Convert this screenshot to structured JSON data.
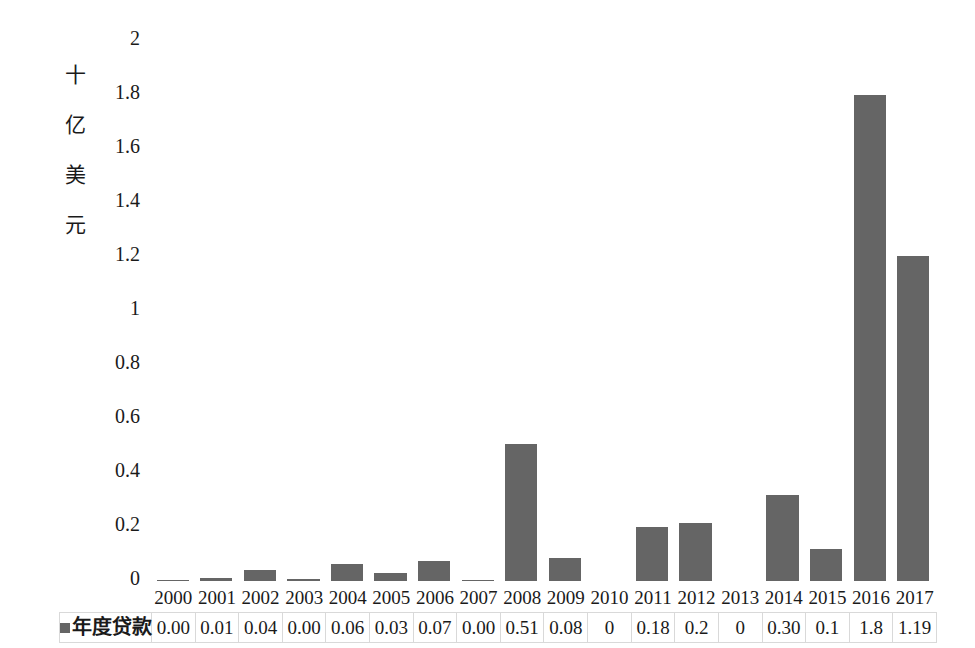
{
  "chart_data": {
    "type": "bar",
    "title": "",
    "subtitle": "",
    "xlabel": "",
    "ylabel": "十亿美元",
    "ylim": [
      0,
      2
    ],
    "ytick_labels": [
      "2",
      "1.8",
      "1.6",
      "1.4",
      "1.2",
      "1",
      "0.8",
      "0.6",
      "0.4",
      "0.2",
      "0"
    ],
    "ytick_values": [
      2,
      1.8,
      1.6,
      1.4,
      1.2,
      1,
      0.8,
      0.6,
      0.4,
      0.2,
      0
    ],
    "grid": false,
    "legend_position": "bottom-left-table",
    "categories": [
      "2000",
      "2001",
      "2002",
      "2003",
      "2004",
      "2005",
      "2006",
      "2007",
      "2008",
      "2009",
      "2010",
      "2011",
      "2012",
      "2013",
      "2014",
      "2015",
      "2016",
      "2017"
    ],
    "series": [
      {
        "name": "年度贷款",
        "color": "#656565",
        "values": [
          0.005,
          0.01,
          0.04,
          0.008,
          0.065,
          0.03,
          0.075,
          0.005,
          0.51,
          0.085,
          0,
          0.2,
          0.215,
          0,
          0.32,
          0.12,
          1.81,
          1.21
        ],
        "labels": [
          "0.00",
          "0.01",
          "0.04",
          "0.00",
          "0.06",
          "0.03",
          "0.07",
          "0.00",
          "0.51",
          "0.08",
          "0",
          "0.18",
          "0.2",
          "0",
          "0.30",
          "0.1",
          "1.8",
          "1.19"
        ]
      }
    ]
  },
  "legend": {
    "swatch_color": "#656565",
    "label": "年度贷款"
  },
  "axis": {
    "y_title_chars": [
      "十",
      "亿",
      "美",
      "元"
    ]
  }
}
